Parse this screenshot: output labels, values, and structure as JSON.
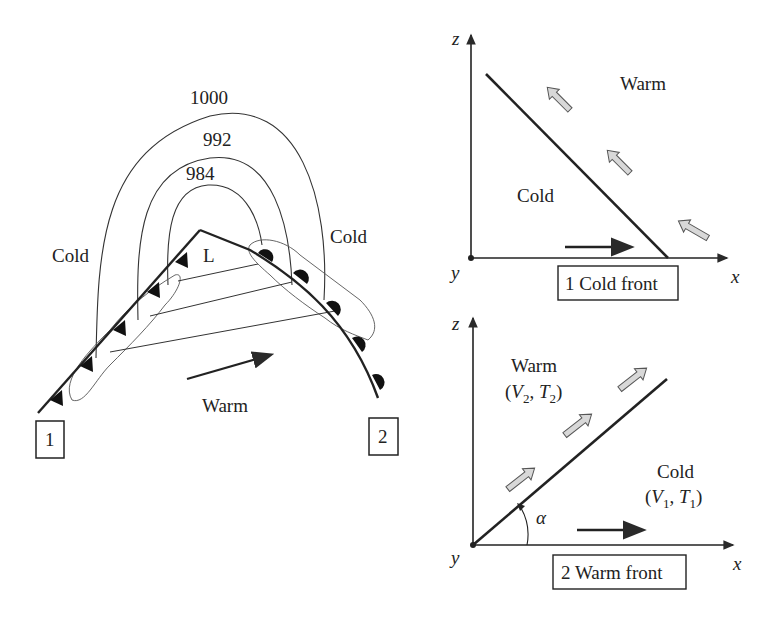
{
  "left_panel": {
    "isobars": [
      {
        "label": "1000"
      },
      {
        "label": "992"
      },
      {
        "label": "984"
      }
    ],
    "cold_left_label": "Cold",
    "cold_right_label": "Cold",
    "low_label": "L",
    "warm_label": "Warm",
    "marker_1": "1",
    "marker_2": "2"
  },
  "cold_front_panel": {
    "z_axis": "z",
    "x_axis": "x",
    "y_axis": "y",
    "warm_label": "Warm",
    "cold_label": "Cold",
    "caption": "1 Cold front"
  },
  "warm_front_panel": {
    "z_axis": "z",
    "x_axis": "x",
    "y_axis": "y",
    "warm_label": "Warm",
    "warm_vars": {
      "open": "(",
      "v": "V",
      "v_sub": "2",
      "sep": ", ",
      "t": "T",
      "t_sub": "2",
      "close": ")"
    },
    "cold_label": "Cold",
    "cold_vars": {
      "open": "(",
      "v": "V",
      "v_sub": "1",
      "sep": ", ",
      "t": "T",
      "t_sub": "1",
      "close": ")"
    },
    "angle_label": "α",
    "caption": "2 Warm front"
  },
  "colors": {
    "line": "#2a2a2a",
    "arrow_fill": "#d8d8d8",
    "arrow_stroke": "#555555"
  }
}
